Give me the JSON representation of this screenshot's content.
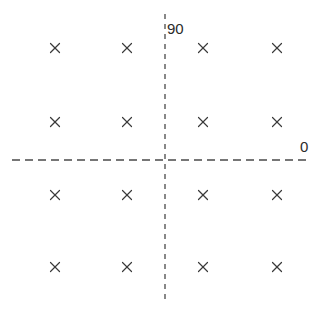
{
  "chart_data": {
    "type": "scatter",
    "title": "",
    "subtitle": "",
    "xlabel": "",
    "ylabel": "",
    "background_color": "#ffffff",
    "marker": {
      "symbol": "x",
      "name": "x-marker",
      "color": "#3a3a3a",
      "size_px": 9,
      "stroke_width_px": 1.2
    },
    "axes": {
      "style": "dashed-crosshair",
      "color": "#4a4a4a",
      "stroke_width_px": 1.3,
      "origin_px": {
        "x": 165,
        "y": 160
      },
      "horizontal": {
        "name": "horizontal-axis",
        "label": "0",
        "label_position": "right-end-above",
        "y_px": 160,
        "x_start_px": 12,
        "x_end_px": 311,
        "dash_px": 8,
        "gap_px": 5
      },
      "vertical": {
        "name": "vertical-axis",
        "label": "90",
        "label_position": "top-right-of-line",
        "x_px": 165,
        "y_start_px": 14,
        "y_end_px": 301,
        "dash_px": 5,
        "gap_px": 5
      },
      "grid": false,
      "ticks": false,
      "legend": "none"
    },
    "points_px": [
      {
        "x": 55,
        "y": 48
      },
      {
        "x": 127,
        "y": 48
      },
      {
        "x": 203,
        "y": 48
      },
      {
        "x": 277,
        "y": 48
      },
      {
        "x": 55,
        "y": 122
      },
      {
        "x": 127,
        "y": 122
      },
      {
        "x": 203,
        "y": 122
      },
      {
        "x": 277,
        "y": 122
      },
      {
        "x": 55,
        "y": 195
      },
      {
        "x": 127,
        "y": 195
      },
      {
        "x": 203,
        "y": 195
      },
      {
        "x": 277,
        "y": 195
      },
      {
        "x": 55,
        "y": 267
      },
      {
        "x": 127,
        "y": 267
      },
      {
        "x": 203,
        "y": 267
      },
      {
        "x": 277,
        "y": 267
      }
    ],
    "point_count": 16,
    "grid_layout": {
      "columns": 4,
      "rows": 4
    }
  },
  "labels": {
    "vertical_axis": "90",
    "horizontal_axis": "0"
  }
}
